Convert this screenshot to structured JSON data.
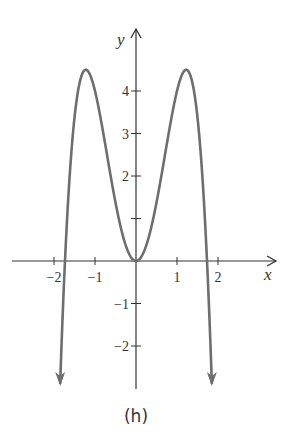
{
  "chart_data": {
    "type": "line",
    "title": "",
    "caption": "(h)",
    "xlabel": "x",
    "ylabel": "y",
    "function": "y = 6x^2 - 2x^4",
    "xlim": [
      -3.0,
      3.4
    ],
    "ylim": [
      -3.0,
      5.2
    ],
    "x_ticks": [
      -2,
      -1,
      1,
      2
    ],
    "x_tick_labels": [
      "−2",
      "−1",
      "1",
      "2"
    ],
    "y_ticks": [
      -2,
      -1,
      1,
      2,
      3,
      4
    ],
    "y_tick_labels": [
      "−2",
      "−1",
      "",
      "2",
      "3",
      "4"
    ],
    "grid": false,
    "legend": null,
    "series": [
      {
        "name": "curve",
        "color": "#6e6e6e",
        "x": [
          -1.85,
          -1.75,
          -1.732,
          -1.6,
          -1.5,
          -1.4,
          -1.3,
          -1.225,
          -1.1,
          -1.0,
          -0.9,
          -0.8,
          -0.7,
          -0.6,
          -0.5,
          -0.4,
          -0.3,
          -0.2,
          -0.1,
          0.0,
          0.1,
          0.2,
          0.3,
          0.4,
          0.5,
          0.6,
          0.7,
          0.8,
          0.9,
          1.0,
          1.1,
          1.225,
          1.3,
          1.4,
          1.5,
          1.6,
          1.732,
          1.75,
          1.85
        ],
        "y": [
          -2.98,
          -0.39,
          0.0,
          2.25,
          3.38,
          4.08,
          4.43,
          4.5,
          4.33,
          4.0,
          3.55,
          3.02,
          2.46,
          1.9,
          1.38,
          0.91,
          0.52,
          0.24,
          0.06,
          0.0,
          0.06,
          0.24,
          0.52,
          0.91,
          1.38,
          1.9,
          2.46,
          3.02,
          3.55,
          4.0,
          4.33,
          4.5,
          4.43,
          4.08,
          3.38,
          2.25,
          0.0,
          -0.39,
          -2.98
        ]
      }
    ],
    "annotations": {
      "end_arrows": "both ends of curve point downward",
      "local_maxima": [
        [
          -1.225,
          4.5
        ],
        [
          1.225,
          4.5
        ]
      ],
      "local_minimum": [
        0,
        0
      ],
      "zeros": [
        -1.732,
        0,
        1.732
      ]
    }
  },
  "style": {
    "curve_color": "#6e6e6e",
    "axis_color": "#333333"
  }
}
